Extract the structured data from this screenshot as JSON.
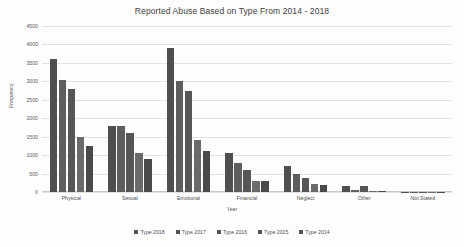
{
  "chart_data": {
    "type": "bar",
    "title": "Reported Abuse Based on Type From 2014 - 2018",
    "xlabel": "Year",
    "ylabel": "Frequency",
    "ylim": [
      0,
      4500
    ],
    "yticks": [
      4500,
      4000,
      3500,
      3000,
      2500,
      2000,
      1500,
      1000,
      500,
      0
    ],
    "grid": true,
    "legend_position": "bottom",
    "categories": [
      "Physical",
      "Sexual",
      "Emotional",
      "Financial",
      "Neglect",
      "Other",
      "Not Stated"
    ],
    "series": [
      {
        "name": "Type 2018",
        "values": [
          3600,
          1800,
          3900,
          1050,
          700,
          150,
          10
        ]
      },
      {
        "name": "Type 2017",
        "values": [
          3050,
          1800,
          3000,
          800,
          480,
          60,
          10
        ]
      },
      {
        "name": "Type 2016",
        "values": [
          2800,
          1600,
          2750,
          600,
          380,
          150,
          5
        ]
      },
      {
        "name": "Type 2015",
        "values": [
          1500,
          1050,
          1400,
          300,
          220,
          15,
          5
        ]
      },
      {
        "name": "Type 2014",
        "values": [
          1250,
          900,
          1100,
          300,
          200,
          15,
          5
        ]
      }
    ]
  }
}
